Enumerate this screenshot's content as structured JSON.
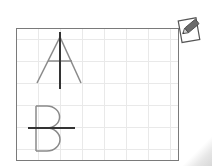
{
  "worksheet": {
    "title": "Lines of symmetry",
    "grid": {
      "cell_px": 22,
      "line_color": "#e9e9e9",
      "border_color": "#7a7a7a"
    },
    "letters": [
      {
        "label": "A",
        "symmetry_axis": "vertical",
        "stroke_color": "#8a8a8a",
        "axis_color": "#333333"
      },
      {
        "label": "B",
        "symmetry_axis": "horizontal",
        "stroke_color": "#8a8a8a",
        "axis_color": "#333333"
      }
    ]
  },
  "icons": {
    "edit": "pencil-on-paper-icon"
  }
}
